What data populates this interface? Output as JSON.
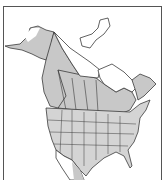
{
  "map": {
    "type": "range-map",
    "region": "North America",
    "colors": {
      "background": "#ffffff",
      "land": "#ffffff",
      "range": "#c8c8c8",
      "borders": "#3a3a3a",
      "frame": "#555555"
    }
  }
}
